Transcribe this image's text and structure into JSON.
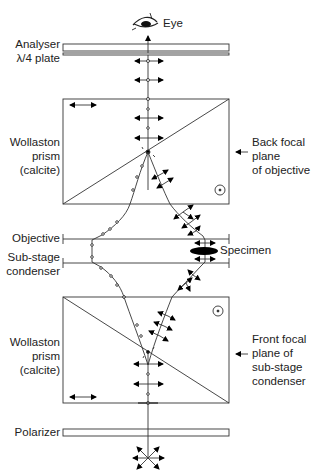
{
  "labels": {
    "eye": "Eye",
    "analyser": "Analyser",
    "quarter_wave_plate": "λ/4 plate",
    "wollaston_top_1": "Wollaston",
    "wollaston_top_2": "prism",
    "wollaston_top_3": "(calcite)",
    "back_focal_1": "Back focal",
    "back_focal_2": "plane",
    "back_focal_3": "of objective",
    "objective": "Objective",
    "specimen": "Specimen",
    "substage_1": "Sub-stage",
    "substage_2": "condenser",
    "wollaston_bottom_1": "Wollaston",
    "wollaston_bottom_2": "prism",
    "wollaston_bottom_3": "(calcite)",
    "front_focal_1": "Front focal",
    "front_focal_2": "plane of",
    "front_focal_3": "sub-stage",
    "front_focal_4": "condenser",
    "polarizer": "Polarizer"
  },
  "colors": {
    "line": "#333333",
    "fill": "#000000",
    "background": "#ffffff"
  }
}
